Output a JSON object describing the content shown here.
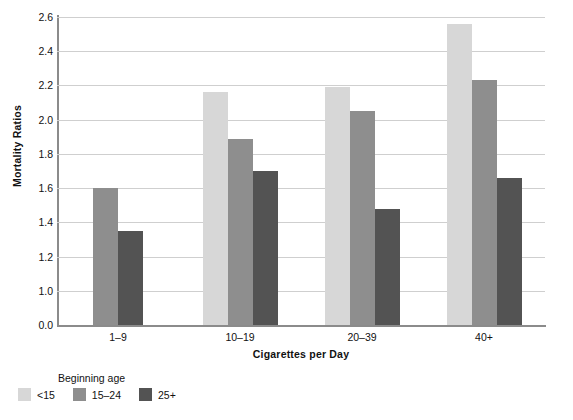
{
  "chart_data": {
    "type": "bar",
    "title": "",
    "xlabel": "Cigarettes per Day",
    "ylabel": "Mortality Ratios",
    "categories": [
      "1–9",
      "10–19",
      "20–39",
      "40+"
    ],
    "series": [
      {
        "name": "<15",
        "color": "#d7d7d7",
        "values": [
          null,
          2.16,
          2.19,
          2.56
        ]
      },
      {
        "name": "15–24",
        "color": "#8e8e8e",
        "values": [
          1.6,
          1.89,
          2.05,
          2.23
        ]
      },
      {
        "name": "25+",
        "color": "#535353",
        "values": [
          1.35,
          1.7,
          1.48,
          1.66
        ]
      }
    ],
    "yticks": [
      "0.0",
      "1.0",
      "1.2",
      "1.4",
      "1.6",
      "1.8",
      "2.0",
      "2.2",
      "2.4",
      "2.6"
    ],
    "ylim": [
      0.0,
      2.6
    ],
    "axis_break": true,
    "grid": true,
    "legend": {
      "title": "Beginning age",
      "position": "bottom-left",
      "entries": [
        "<15",
        "15–24",
        "25+"
      ]
    }
  }
}
